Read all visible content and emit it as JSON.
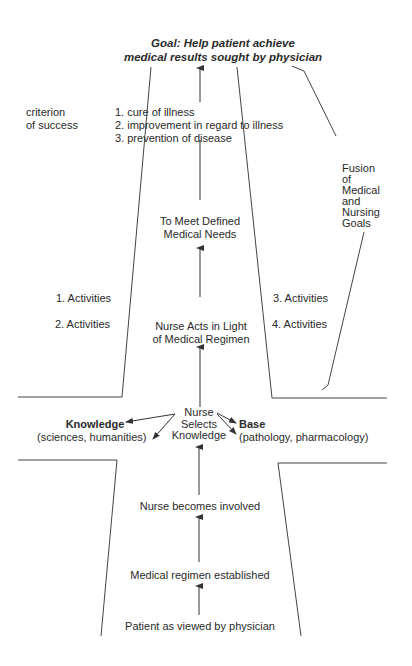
{
  "goal": {
    "line1": "Goal: Help patient achieve",
    "line2": "medical results sought by physician"
  },
  "criterion": {
    "line1": "criterion",
    "line2": "of success"
  },
  "success_list": [
    "1.  cure of illness",
    "2.  improvement in regard to illness",
    "3.  prevention of disease"
  ],
  "fusion": {
    "lines": [
      "Fusion",
      "of",
      "Medical",
      "and",
      "Nursing",
      "Goals"
    ]
  },
  "meet_needs": {
    "line1": "To Meet Defined",
    "line2": "Medical Needs"
  },
  "activities": {
    "left": [
      "1.  Activities",
      "2.  Activities"
    ],
    "right": [
      "3.  Activities",
      "4.  Activities"
    ]
  },
  "nurse_acts": {
    "line1": "Nurse Acts in Light",
    "line2": "of Medical Regimen"
  },
  "nurse_selects": {
    "line1": "Nurse",
    "line2": "Selects",
    "line3": "Knowledge"
  },
  "knowledge": {
    "title": "Knowledge",
    "detail": "(sciences, humanities)"
  },
  "base": {
    "title": "Base",
    "detail": "(pathology, pharmacology)"
  },
  "flow_bottom": [
    "Nurse becomes involved",
    "Medical regimen established",
    "Patient as viewed by physician"
  ]
}
